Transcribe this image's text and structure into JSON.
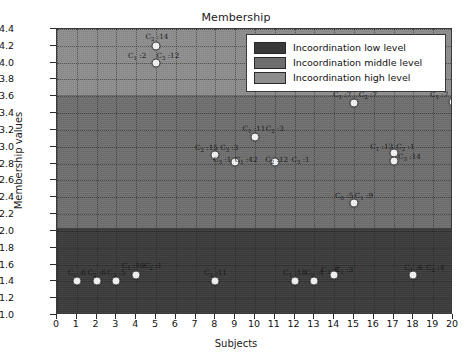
{
  "chart_data": {
    "type": "scatter",
    "title": "Membership",
    "xlabel": "Subjects",
    "ylabel": "Membership values",
    "xlim": [
      0,
      20
    ],
    "ylim": [
      1.0,
      4.4
    ],
    "xticks": [
      0,
      1,
      2,
      3,
      4,
      5,
      6,
      7,
      8,
      9,
      10,
      11,
      12,
      13,
      14,
      15,
      16,
      17,
      18,
      19,
      20
    ],
    "yticks": [
      1.0,
      1.2,
      1.4,
      1.6,
      1.8,
      2.0,
      2.2,
      2.4,
      2.6,
      2.8,
      3.0,
      3.2,
      3.4,
      3.6,
      3.8,
      4.0,
      4.2,
      4.4
    ],
    "grid": true,
    "legend_position": "upper right",
    "legend": [
      {
        "label": "Incoordination low level",
        "color": "#3a3a3a"
      },
      {
        "label": "Incoordination middle level",
        "color": "#6e6e6e"
      },
      {
        "label": "Incoordination high level",
        "color": "#8d8d8d"
      }
    ],
    "bands": [
      {
        "name": "low",
        "y0": 1.0,
        "y1": 2.04,
        "color": "#3a3a3a"
      },
      {
        "name": "middle",
        "y0": 2.04,
        "y1": 3.62,
        "color": "#6e6e6e"
      },
      {
        "name": "high",
        "y0": 3.62,
        "y1": 4.4,
        "color": "#8d8d8d"
      }
    ],
    "points": [
      {
        "x": 1,
        "y": 1.41,
        "label": "C1 :6",
        "lx": 1.0,
        "ly": 1.5
      },
      {
        "x": 2,
        "y": 1.41,
        "label": "C2 :6",
        "lx": 2.0,
        "ly": 1.5
      },
      {
        "x": 3,
        "y": 1.41,
        "label": "C3 :5",
        "lx": 3.0,
        "ly": 1.5
      },
      {
        "x": 4,
        "y": 1.47,
        "label": "C1 :10",
        "lx": 3.85,
        "ly": 1.58
      },
      {
        "x": 4,
        "y": 1.47,
        "label": "C2 :1",
        "lx": 4.85,
        "ly": 1.58
      },
      {
        "x": 5,
        "y": 4.2,
        "label": "C2 :14",
        "lx": 5.05,
        "ly": 4.3
      },
      {
        "x": 5,
        "y": 4.0,
        "label": "C1 :2",
        "lx": 4.05,
        "ly": 4.08
      },
      {
        "x": 5,
        "y": 4.0,
        "label": "C3 :12",
        "lx": 5.6,
        "ly": 4.08
      },
      {
        "x": 8,
        "y": 1.41,
        "label": "C2 :11",
        "lx": 8.0,
        "ly": 1.5
      },
      {
        "x": 8,
        "y": 2.9,
        "label": "C2 :15",
        "lx": 7.55,
        "ly": 2.99
      },
      {
        "x": 8,
        "y": 2.9,
        "label": "C3 :3",
        "lx": 8.7,
        "ly": 2.99
      },
      {
        "x": 8,
        "y": 2.9,
        "label": "C3 :1",
        "lx": 8.35,
        "ly": 2.84
      },
      {
        "x": 9,
        "y": 2.82,
        "label": "C1 :42",
        "lx": 9.55,
        "ly": 2.84
      },
      {
        "x": 10,
        "y": 3.12,
        "label": "C1 :11",
        "lx": 9.95,
        "ly": 3.21
      },
      {
        "x": 10,
        "y": 3.12,
        "label": "C2 :3",
        "lx": 11.0,
        "ly": 3.21
      },
      {
        "x": 11,
        "y": 2.82,
        "label": "C2 :12",
        "lx": 11.1,
        "ly": 2.84
      },
      {
        "x": 11,
        "y": 2.82,
        "label": "C3 :1",
        "lx": 12.3,
        "ly": 2.84
      },
      {
        "x": 12,
        "y": 1.41,
        "label": "C1 :18",
        "lx": 12.0,
        "ly": 1.5
      },
      {
        "x": 13,
        "y": 1.41,
        "label": "C2 :4",
        "lx": 13.0,
        "ly": 1.5
      },
      {
        "x": 13,
        "y": 1.41,
        "label": "C3 :2",
        "lx": 13.8,
        "ly": 1.54
      },
      {
        "x": 14,
        "y": 1.47,
        "label": "C1 :3",
        "lx": 14.5,
        "ly": 1.54
      },
      {
        "x": 15,
        "y": 3.52,
        "label": "C1 :7",
        "lx": 14.4,
        "ly": 3.62
      },
      {
        "x": 15,
        "y": 3.52,
        "label": "C2 :7",
        "lx": 15.7,
        "ly": 3.62
      },
      {
        "x": 15,
        "y": 2.33,
        "label": "C0 :5",
        "lx": 14.5,
        "ly": 2.41
      },
      {
        "x": 15,
        "y": 2.33,
        "label": "C1 :9",
        "lx": 15.5,
        "ly": 2.41
      },
      {
        "x": 17,
        "y": 2.92,
        "label": "C1 :13",
        "lx": 16.4,
        "ly": 3.0
      },
      {
        "x": 17,
        "y": 2.92,
        "label": "C2 :1",
        "lx": 17.6,
        "ly": 3.0
      },
      {
        "x": 17,
        "y": 2.83,
        "label": "C3 :14",
        "lx": 17.8,
        "ly": 2.88
      },
      {
        "x": 18,
        "y": 1.47,
        "label": "C1 :6",
        "lx": 18.0,
        "ly": 1.56
      },
      {
        "x": 18,
        "y": 1.47,
        "label": "C2 :4",
        "lx": 19.1,
        "ly": 1.56
      },
      {
        "x": 20,
        "y": 3.53,
        "label": "C1 :7",
        "lx": 19.3,
        "ly": 3.62
      },
      {
        "x": 20,
        "y": 3.53,
        "label": "C2 :7",
        "lx": 20.4,
        "ly": 3.62
      }
    ]
  }
}
